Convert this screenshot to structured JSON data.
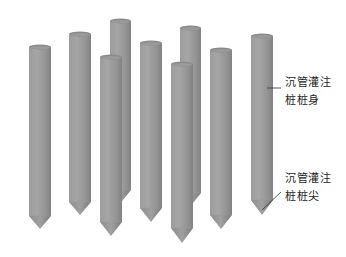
{
  "figure": {
    "background": "#ffffff",
    "pile_color_light": "#a4a4a4",
    "pile_color_mid": "#969696",
    "pile_color_dark": "#7e7e7e",
    "cap_color": "#8a8a8a",
    "piles": [
      {
        "id": 1,
        "x": 29,
        "width": 22,
        "top": 47,
        "cone_start": 216,
        "tip": 229,
        "layer": "front"
      },
      {
        "id": 2,
        "x": 69,
        "width": 22,
        "top": 34,
        "cone_start": 202,
        "tip": 215,
        "layer": "front"
      },
      {
        "id": 3,
        "x": 110,
        "width": 21,
        "top": 21,
        "cone_start": 190,
        "tip": 203,
        "layer": "back"
      },
      {
        "id": 4,
        "x": 100,
        "width": 22,
        "top": 57,
        "cone_start": 222,
        "tip": 236,
        "layer": "front"
      },
      {
        "id": 5,
        "x": 140,
        "width": 22,
        "top": 43,
        "cone_start": 208,
        "tip": 222,
        "layer": "front"
      },
      {
        "id": 6,
        "x": 180,
        "width": 21,
        "top": 28,
        "cone_start": 193,
        "tip": 206,
        "layer": "back"
      },
      {
        "id": 7,
        "x": 171,
        "width": 22,
        "top": 64,
        "cone_start": 228,
        "tip": 243,
        "layer": "front"
      },
      {
        "id": 8,
        "x": 210,
        "width": 22,
        "top": 50,
        "cone_start": 215,
        "tip": 229,
        "layer": "front"
      },
      {
        "id": 9,
        "x": 251,
        "width": 22,
        "top": 36,
        "cone_start": 200,
        "tip": 215,
        "layer": "front"
      }
    ]
  },
  "labels": {
    "body": {
      "line1": "沉管灌注",
      "line2": "桩桩身"
    },
    "tip": {
      "line1": "沉管灌注",
      "line2": "桩桩尖"
    }
  }
}
